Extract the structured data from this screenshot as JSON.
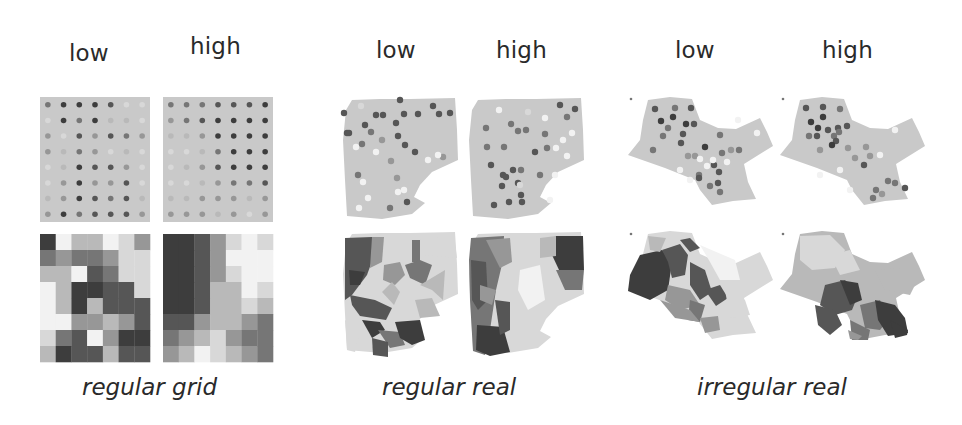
{
  "colors": {
    "background": "#ffffff",
    "panel_fill": "#c9c9c9",
    "text": "#2a2a2a",
    "ramp": [
      "#f2f2f2",
      "#d8d8d8",
      "#b9b9b9",
      "#979797",
      "#767676",
      "#565656",
      "#3d3d3d"
    ]
  },
  "groups": [
    {
      "caption": "regular grid",
      "low_label": "low",
      "high_label": "high"
    },
    {
      "caption": "regular real",
      "low_label": "low",
      "high_label": "high"
    },
    {
      "caption": "irregular real",
      "low_label": "low",
      "high_label": "high"
    }
  ],
  "chart_data": {
    "type": "heatmap",
    "title": "",
    "columns": [
      "low",
      "high"
    ],
    "groups": [
      "regular grid",
      "regular real",
      "irregular real"
    ],
    "regular_grid": {
      "rows": 8,
      "cols": 7,
      "low_choropleth": [
        [
          6,
          0,
          2,
          2,
          0,
          1,
          3
        ],
        [
          4,
          3,
          4,
          4,
          3,
          1,
          1
        ],
        [
          2,
          2,
          0,
          5,
          4,
          1,
          1
        ],
        [
          0,
          2,
          6,
          6,
          5,
          5,
          1
        ],
        [
          0,
          2,
          6,
          2,
          5,
          5,
          5
        ],
        [
          0,
          0,
          3,
          3,
          2,
          3,
          5
        ],
        [
          1,
          4,
          5,
          0,
          3,
          6,
          6
        ],
        [
          2,
          6,
          5,
          5,
          2,
          5,
          5
        ]
      ],
      "high_choropleth": [
        [
          6,
          6,
          5,
          3,
          1,
          0,
          1
        ],
        [
          6,
          6,
          5,
          3,
          0,
          0,
          0
        ],
        [
          6,
          6,
          5,
          3,
          1,
          0,
          0
        ],
        [
          6,
          6,
          5,
          2,
          2,
          0,
          1
        ],
        [
          6,
          6,
          5,
          2,
          2,
          1,
          2
        ],
        [
          5,
          5,
          3,
          2,
          2,
          3,
          4
        ],
        [
          4,
          3,
          2,
          1,
          3,
          4,
          4
        ],
        [
          3,
          2,
          0,
          1,
          2,
          3,
          4
        ]
      ],
      "low_points": [
        [
          3,
          5,
          5,
          5,
          4,
          0,
          0
        ],
        [
          0,
          5,
          3,
          5,
          1,
          1,
          0
        ],
        [
          2,
          0,
          4,
          2,
          4,
          3,
          2
        ],
        [
          2,
          1,
          3,
          2,
          0,
          1,
          0
        ],
        [
          0,
          1,
          5,
          4,
          4,
          2,
          0
        ],
        [
          0,
          2,
          5,
          2,
          2,
          4,
          0
        ],
        [
          1,
          2,
          5,
          4,
          3,
          4,
          1
        ],
        [
          2,
          5,
          3,
          4,
          4,
          4,
          2
        ]
      ],
      "high_points": [
        [
          3,
          3,
          3,
          4,
          4,
          4,
          5
        ],
        [
          2,
          3,
          4,
          5,
          5,
          5,
          5
        ],
        [
          1,
          1,
          2,
          5,
          5,
          5,
          5
        ],
        [
          0,
          0,
          1,
          3,
          5,
          5,
          5
        ],
        [
          0,
          1,
          2,
          4,
          5,
          5,
          5
        ],
        [
          0,
          0,
          1,
          2,
          3,
          3,
          4
        ],
        [
          1,
          1,
          2,
          2,
          2,
          1,
          2
        ],
        [
          2,
          2,
          2,
          1,
          2,
          0,
          2
        ]
      ]
    }
  }
}
